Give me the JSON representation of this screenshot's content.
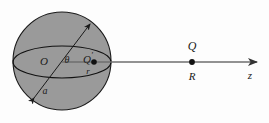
{
  "figure": {
    "background_color": "#fdfdfd",
    "sphere": {
      "fill_color": "#9a9a9a",
      "stroke_color": "#1a1a1a",
      "center_x": 62,
      "center_y": 61,
      "radius": 49
    },
    "equator": {
      "center_x": 62,
      "center_y": 62,
      "rx": 49,
      "ry": 16,
      "stroke_color": "#111111"
    },
    "axis": {
      "stroke_color": "#6e6e6e",
      "start_x": 62,
      "end_x": 258,
      "y": 62
    },
    "labels": {
      "center": "O",
      "angle": "θ",
      "source_point": "Q",
      "source_point_prime": "′",
      "source_radius": "r",
      "sphere_radius": "a",
      "field_point": "Q",
      "field_distance": "R",
      "axis": "z"
    }
  }
}
